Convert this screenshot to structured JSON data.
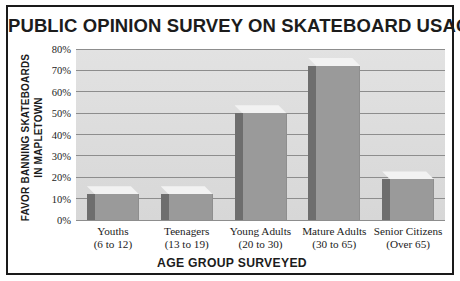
{
  "chart_data": {
    "type": "bar",
    "title": "PUBLIC OPINION SURVEY ON SKATEBOARD USAGE",
    "xlabel": "AGE GROUP SURVEYED",
    "ylabel": "FAVOR BANNING SKATEBOARDS IN MAPLETOWN",
    "ylabel_line1": "FAVOR BANNING SKATEBOARDS",
    "ylabel_line2": "IN MAPLETOWN",
    "categories": [
      "Youths (6 to 12)",
      "Teenagers (13 to 19)",
      "Young Adults (20 to 30)",
      "Mature Adults (30 to 65)",
      "Senior Citizens (Over 65)"
    ],
    "category_lines": [
      {
        "name": "Youths",
        "range": "(6 to 12)"
      },
      {
        "name": "Teenagers",
        "range": "(13 to 19)"
      },
      {
        "name": "Young Adults",
        "range": "(20 to 30)"
      },
      {
        "name": "Mature Adults",
        "range": "(30 to 65)"
      },
      {
        "name": "Senior Citizens",
        "range": "(Over 65)"
      }
    ],
    "values": [
      12,
      12,
      50,
      72,
      19
    ],
    "ylim": [
      0,
      80
    ],
    "ytick_values": [
      0,
      10,
      20,
      30,
      40,
      50,
      60,
      70,
      80
    ],
    "ytick_labels": [
      "0%",
      "10%",
      "20%",
      "30%",
      "40%",
      "50%",
      "60%",
      "70%",
      "80%"
    ],
    "grid": true,
    "legend": "none",
    "style": "3d-column",
    "colors": {
      "bar_front": "#9a9a9a",
      "bar_side": "#6e6e6e",
      "bar_top": "#f2f2f2",
      "plot_background": "#dedede",
      "gridline": "#8d8d8d",
      "frame": "#1a1a1a",
      "text": "#1c1c1c"
    }
  }
}
